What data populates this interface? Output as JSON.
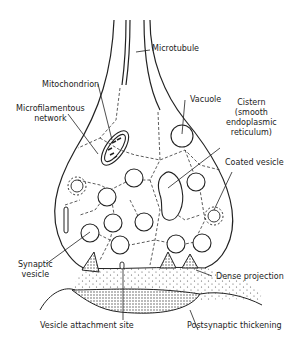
{
  "diagram": {
    "labels": {
      "microtubule": "Microtubule",
      "mitochondrion": "Mitochondrion",
      "microfilamentous_network": "Microfilamentous network",
      "microfilamentous_line1": "Microfilamentous",
      "microfilamentous_line2": "network",
      "vacuole": "Vacuole",
      "cistern_line1": "Cistern",
      "cistern_line2": "(smooth",
      "cistern_line3": "endoplasmic",
      "cistern_line4": "reticulum)",
      "coated_vesicle": "Coated vesicle",
      "synaptic_vesicle_line1": "Synaptic",
      "synaptic_vesicle_line2": "vesicle",
      "dense_projection": "Dense projection",
      "vesicle_attachment_site": "Vesicle attachment site",
      "postsynaptic_thickening": "Postsynaptic thickening"
    }
  }
}
